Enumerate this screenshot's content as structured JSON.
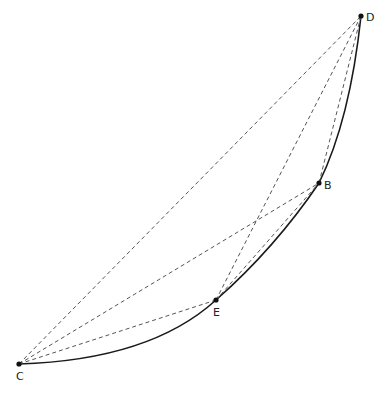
{
  "diagram": {
    "points": [
      {
        "id": "C",
        "label": "C",
        "x": 19,
        "y": 364,
        "lx": 16,
        "ly": 380
      },
      {
        "id": "E",
        "label": "E",
        "x": 216,
        "y": 300,
        "lx": 213,
        "ly": 316
      },
      {
        "id": "B",
        "label": "B",
        "x": 319,
        "y": 183,
        "lx": 324,
        "ly": 189
      },
      {
        "id": "D",
        "label": "D",
        "x": 361,
        "y": 16,
        "lx": 366,
        "ly": 21
      }
    ],
    "curve": "M19,364 Q150,360 216,300 Q275,248 319,183 Q350,120 361,16",
    "dashed_segments": [
      [
        "C",
        "D"
      ],
      [
        "C",
        "B"
      ],
      [
        "C",
        "E"
      ],
      [
        "E",
        "B"
      ],
      [
        "E",
        "D"
      ],
      [
        "B",
        "D"
      ]
    ],
    "colors": {
      "stroke": "#1a1a1a",
      "dash": "#555555"
    }
  }
}
